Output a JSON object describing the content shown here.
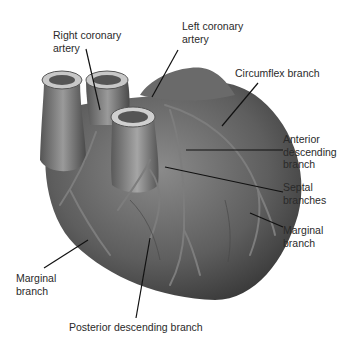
{
  "diagram": {
    "colors": {
      "heart_dark": "#3a3a3a",
      "heart_mid": "#6a6a6a",
      "heart_light": "#9a9a9a",
      "vessel": "#7d7d7d",
      "leader": "#111111",
      "text": "#2a2a2a"
    },
    "labels": [
      {
        "id": "right-coronary-artery",
        "text": "Right coronary\nartery"
      },
      {
        "id": "left-coronary-artery",
        "text": "Left coronary\nartery"
      },
      {
        "id": "circumflex-branch",
        "text": "Circumflex branch"
      },
      {
        "id": "anterior-descending-branch",
        "text": "Anterior\ndescending\nbranch"
      },
      {
        "id": "septal-branches",
        "text": "Septal\nbranches"
      },
      {
        "id": "marginal-branch-right",
        "text": "Marginal\nbranch"
      },
      {
        "id": "marginal-branch-left",
        "text": "Marginal\nbranch"
      },
      {
        "id": "posterior-descending-branch",
        "text": "Posterior descending branch"
      }
    ]
  }
}
